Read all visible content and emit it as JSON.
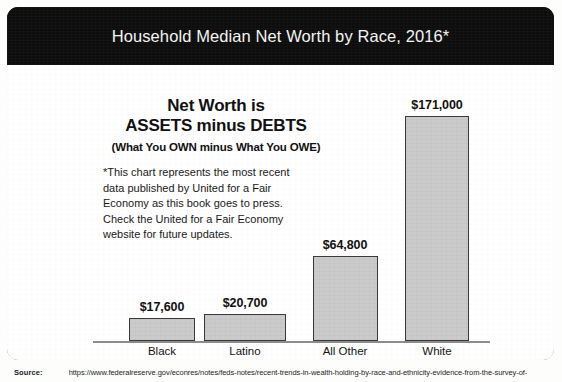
{
  "header": {
    "title": "Household Median Net Worth by Race, 2016*"
  },
  "callout": {
    "line1": "Net Worth is",
    "line2": "ASSETS minus DEBTS",
    "line3": "(What You OWN minus What You OWE)"
  },
  "footnote": {
    "text": "*This chart represents the most recent data published by United for a Fair Economy as this book goes to press. Check the United for a Fair Economy website for future updates."
  },
  "source": {
    "label": "Source:",
    "url": "https://www.federalreserve.gov/econres/notes/feds-notes/recent-trends-in-wealth-holding-by-race-and-ethnicity-evidence-from-the-survey-of-"
  },
  "colors": {
    "banner_background": "#0d0d0d",
    "banner_text": "#f4f4f4",
    "bar_fill": "#c9c9c9",
    "bar_border": "#3a3a3a",
    "axis": "#8c8c8c",
    "body_text": "#111111"
  },
  "chart_data": {
    "type": "bar",
    "title": "Household Median Net Worth by Race, 2016*",
    "xlabel": "",
    "ylabel": "",
    "grid": false,
    "legend": "none",
    "ylim": [
      0,
      185000
    ],
    "categories": [
      "Black",
      "Latino",
      "All Other",
      "White"
    ],
    "values": [
      17600,
      20700,
      64800,
      171000
    ],
    "value_labels": [
      "$17,600",
      "$20,700",
      "$64,800",
      "$171,000"
    ],
    "annotations": [
      "Net Worth is",
      "ASSETS minus DEBTS",
      "(What You OWN minus What You OWE)",
      "*This chart represents the most recent data published by United for a Fair Economy as this book goes to press. Check the United for a Fair Economy website for future updates."
    ]
  }
}
